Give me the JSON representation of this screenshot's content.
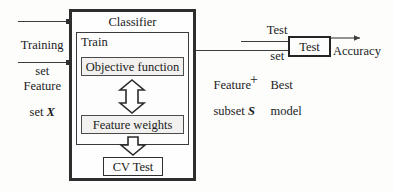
{
  "diagram": {
    "classifier_box": {
      "label": "Classifier"
    },
    "train_box": {
      "label": "Train"
    },
    "objective_box": {
      "label": "Objective function"
    },
    "feature_weights_box": {
      "label": "Feature weights"
    },
    "cv_test_box": {
      "label": "CV Test"
    },
    "test_box": {
      "label": "Test"
    },
    "inputs": {
      "training_set_line1": "Training",
      "training_set_line2": "set",
      "feature_set_line1": "Feature",
      "feature_set_line2_prefix": "set ",
      "feature_set_symbol": "X"
    },
    "outputs": {
      "feature_subset_line1": "Feature",
      "feature_subset_line2_prefix": "subset ",
      "feature_subset_symbol": "S",
      "plus_sign": "+",
      "best_model_line1": "Best",
      "best_model_line2": "model",
      "test_set_line1": "Test",
      "test_set_line2": "set",
      "accuracy_label": "Accuracy"
    },
    "arrows": {
      "objective_to_weights": "double-headed-vertical-block-arrow",
      "weights_to_cv": "down-block-arrow",
      "classifier_to_test": "horizontal-line",
      "test_set_to_test": "horizontal-line",
      "test_to_accuracy": "arrow-right"
    },
    "colors": {
      "stroke": "#2e2e2e",
      "fill_light": "#f2f1ef",
      "background": "#fdfdfc",
      "text": "#1c1c1c"
    }
  }
}
